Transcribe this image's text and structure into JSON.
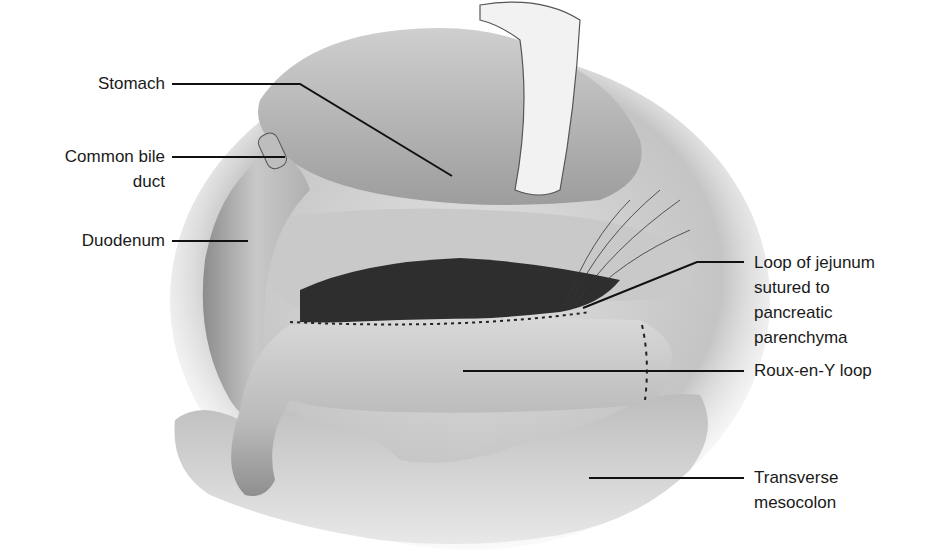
{
  "figure": {
    "colors": {
      "background": "#ffffff",
      "tissue_light": "#d9d9d9",
      "tissue_mid": "#a8a8a8",
      "tissue_dark": "#3a3a3a",
      "leader_line": "#111111"
    }
  },
  "labels": {
    "stomach": "Stomach",
    "common_bile_duct_line1": "Common bile",
    "common_bile_duct_line2": "duct",
    "duodenum": "Duodenum",
    "jejunum_line1": "Loop of jejunum",
    "jejunum_line2": "sutured to",
    "jejunum_line3": "pancreatic",
    "jejunum_line4": "parenchyma",
    "roux_loop": "Roux-en-Y loop",
    "mesocolon_line1": "Transverse",
    "mesocolon_line2": "mesocolon"
  }
}
